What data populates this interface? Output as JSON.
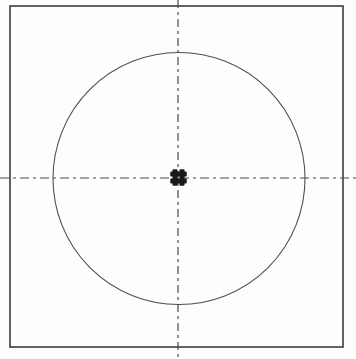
{
  "drawing": {
    "description": "engineering-drawing-square-circle-centerlines",
    "canvas": {
      "width": 356,
      "height": 359,
      "background_color": "#fdfdfc"
    },
    "square": {
      "x": 10,
      "y": 6,
      "width": 333,
      "height": 341,
      "stroke": "#3b3b3b",
      "stroke_width": 1.6
    },
    "circle": {
      "cx": 179,
      "cy": 178.5,
      "r": 126,
      "stroke": "#4f4f4f",
      "stroke_width": 1.1
    },
    "centerlines": {
      "stroke": "#4a4a4a",
      "stroke_width": 1.2,
      "vertical": {
        "x": 178,
        "y1": 0,
        "y2": 359,
        "dash": "8 4 3 4"
      },
      "horizontal": {
        "y": 178,
        "x1": 0,
        "x2": 356,
        "dash": "9 4 3 4"
      }
    },
    "center_marker": {
      "cx": 178.5,
      "cy": 177.5,
      "bar_length": 16.5,
      "bar_thickness": 5,
      "bar_offset": 3.5,
      "corner_radius": 1,
      "fill": "#1a1a1a"
    }
  }
}
